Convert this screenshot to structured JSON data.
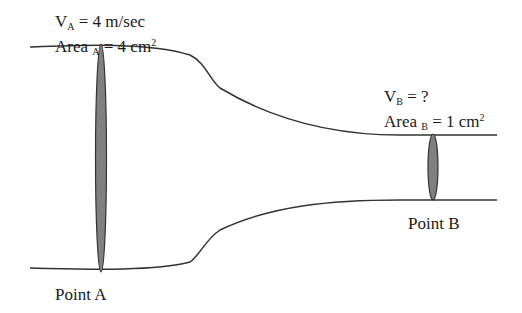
{
  "point_a": {
    "velocity_var": "V",
    "velocity_sub": "A",
    "velocity_value": " = 4 m/sec",
    "area_var": "Area ",
    "area_sub": "A",
    "area_value": " = 4 cm",
    "area_exp": "2",
    "label": "Point A"
  },
  "point_b": {
    "velocity_var": "V",
    "velocity_sub": "B",
    "velocity_value": " = ?",
    "area_var": "Area ",
    "area_sub": "B",
    "area_value": " = 1 cm",
    "area_exp": "2",
    "label": "Point B"
  },
  "colors": {
    "stroke": "#333333",
    "cross_section_fill": "#808080"
  }
}
